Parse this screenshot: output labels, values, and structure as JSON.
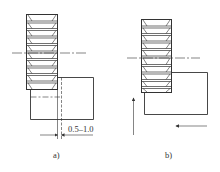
{
  "figure": {
    "panels": [
      {
        "id": "a",
        "label": "a)",
        "dimension_text": "0.5–1.0"
      },
      {
        "id": "b",
        "label": "b)"
      }
    ]
  },
  "colors": {
    "line": "#333333",
    "background": "#ffffff"
  }
}
